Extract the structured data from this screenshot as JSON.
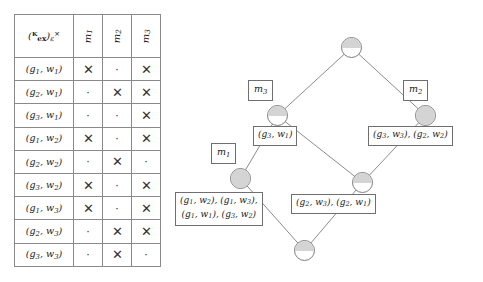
{
  "figure": {
    "kind": "formal-concept-analysis",
    "table_caption": "",
    "diagram_caption": ""
  },
  "table": {
    "corner_label": "(K_ex)_e^x",
    "corner_parts": {
      "open": "(",
      "base": "ᴷ",
      "base_sub": "ex",
      "close": ")",
      "close_sub": "ε",
      "close_sup": "×"
    },
    "column_headers": [
      "m1",
      "m2",
      "m3"
    ],
    "column_header_parts": [
      {
        "base": "m",
        "sub": "1"
      },
      {
        "base": "m",
        "sub": "2"
      },
      {
        "base": "m",
        "sub": "3"
      }
    ],
    "row_headers": [
      "(g1, w1)",
      "(g2, w1)",
      "(g3, w1)",
      "(g1, w2)",
      "(g2, w2)",
      "(g3, w2)",
      "(g1, w3)",
      "(g2, w3)",
      "(g3, w3)"
    ],
    "row_header_parts": [
      {
        "g": "g",
        "gs": "1",
        "w": "w",
        "ws": "1"
      },
      {
        "g": "g",
        "gs": "2",
        "w": "w",
        "ws": "1"
      },
      {
        "g": "g",
        "gs": "3",
        "w": "w",
        "ws": "1"
      },
      {
        "g": "g",
        "gs": "1",
        "w": "w",
        "ws": "2"
      },
      {
        "g": "g",
        "gs": "2",
        "w": "w",
        "ws": "2"
      },
      {
        "g": "g",
        "gs": "3",
        "w": "w",
        "ws": "2"
      },
      {
        "g": "g",
        "gs": "1",
        "w": "w",
        "ws": "3"
      },
      {
        "g": "g",
        "gs": "2",
        "w": "w",
        "ws": "3"
      },
      {
        "g": "g",
        "gs": "3",
        "w": "w",
        "ws": "3"
      }
    ],
    "cross_glyph": "✕",
    "dot_glyph": "·",
    "cells": [
      [
        "cross",
        "dot",
        "cross"
      ],
      [
        "dot",
        "cross",
        "cross"
      ],
      [
        "dot",
        "dot",
        "cross"
      ],
      [
        "cross",
        "dot",
        "cross"
      ],
      [
        "dot",
        "cross",
        "dot"
      ],
      [
        "cross",
        "dot",
        "cross"
      ],
      [
        "cross",
        "dot",
        "cross"
      ],
      [
        "dot",
        "cross",
        "cross"
      ],
      [
        "dot",
        "cross",
        "dot"
      ]
    ]
  },
  "lattice": {
    "node_fill_color": "#d4d4d4",
    "node_border_color": "#7d7d7d",
    "edge_color": "#8c8c8c",
    "nodes": [
      {
        "id": "top",
        "fill": "half",
        "x": 166,
        "y": 37
      },
      {
        "id": "left1",
        "fill": "half",
        "x": 92,
        "y": 105
      },
      {
        "id": "right1",
        "fill": "full",
        "x": 240,
        "y": 105
      },
      {
        "id": "left2",
        "fill": "full",
        "x": 55,
        "y": 168
      },
      {
        "id": "right2",
        "fill": "half",
        "x": 177,
        "y": 172
      },
      {
        "id": "bottom",
        "fill": "half",
        "x": 119,
        "y": 240
      }
    ],
    "attribute_labels": [
      {
        "id": "m3",
        "text": "m3",
        "base": "m",
        "sub": "3",
        "x": 73,
        "y": 80
      },
      {
        "id": "m2",
        "text": "m2",
        "base": "m",
        "sub": "2",
        "x": 228,
        "y": 80
      },
      {
        "id": "m1",
        "text": "m1",
        "base": "m",
        "sub": "1",
        "x": 36,
        "y": 143
      }
    ],
    "object_labels": [
      {
        "id": "lbl-g3w1",
        "lines": [
          [
            {
              "g": "g",
              "gs": "3",
              "w": "w",
              "ws": "1"
            }
          ]
        ],
        "x": 78,
        "y": 126
      },
      {
        "id": "lbl-g3w3-g2w2",
        "lines": [
          [
            {
              "g": "g",
              "gs": "3",
              "w": "w",
              "ws": "3"
            },
            {
              "g": "g",
              "gs": "2",
              "w": "w",
              "ws": "2"
            }
          ]
        ],
        "x": 193,
        "y": 126
      },
      {
        "id": "lbl-g1w2-g1w3-g1w1-g3w2",
        "lines": [
          [
            {
              "g": "g",
              "gs": "1",
              "w": "w",
              "ws": "2"
            },
            {
              "g": "g",
              "gs": "1",
              "w": "w",
              "ws": "3"
            }
          ],
          [
            {
              "g": "g",
              "gs": "1",
              "w": "w",
              "ws": "1"
            },
            {
              "g": "g",
              "gs": "3",
              "w": "w",
              "ws": "2"
            }
          ]
        ],
        "x": 0,
        "y": 192
      },
      {
        "id": "lbl-g2w3-g2w1",
        "lines": [
          [
            {
              "g": "g",
              "gs": "2",
              "w": "w",
              "ws": "3"
            },
            {
              "g": "g",
              "gs": "2",
              "w": "w",
              "ws": "1"
            }
          ]
        ],
        "x": 116,
        "y": 194
      }
    ],
    "edges": [
      {
        "from": "left1",
        "to": "top"
      },
      {
        "from": "right1",
        "to": "top"
      },
      {
        "from": "left2",
        "to": "left1"
      },
      {
        "from": "right2",
        "to": "left1"
      },
      {
        "from": "right2",
        "to": "right1"
      },
      {
        "from": "bottom",
        "to": "left2"
      },
      {
        "from": "bottom",
        "to": "right2"
      }
    ]
  }
}
